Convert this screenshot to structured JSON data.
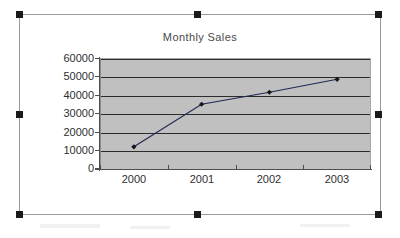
{
  "chart_data": {
    "type": "line",
    "title": "Monthly Sales",
    "xlabel": "",
    "ylabel": "",
    "categories": [
      "2000",
      "2001",
      "2002",
      "2003"
    ],
    "series": [
      {
        "name": "Sales",
        "values": [
          12000,
          35000,
          41500,
          48500
        ],
        "marker": "diamond",
        "line_color": "#1f2a52",
        "marker_color": "#161616"
      }
    ],
    "ylim": [
      0,
      60000
    ],
    "ytick_labels": [
      "60000",
      "50000",
      "40000",
      "30000",
      "20000",
      "10000",
      "0"
    ],
    "ytick_values": [
      60000,
      50000,
      40000,
      30000,
      20000,
      10000,
      0
    ],
    "grid": true,
    "grid_axis": "y",
    "legend": false,
    "legend_position": "none",
    "plot_background": "#c0c0c0",
    "chart_background": "#ffffff"
  },
  "chart_object": {
    "title": "Monthly Sales",
    "selected": true,
    "border_color": "#9a9a9a",
    "handle_color": "#1a1a1a",
    "handles": [
      "top-left",
      "top-middle",
      "top-right",
      "middle-left",
      "middle-right",
      "bottom-left",
      "bottom-middle",
      "bottom-right"
    ]
  }
}
